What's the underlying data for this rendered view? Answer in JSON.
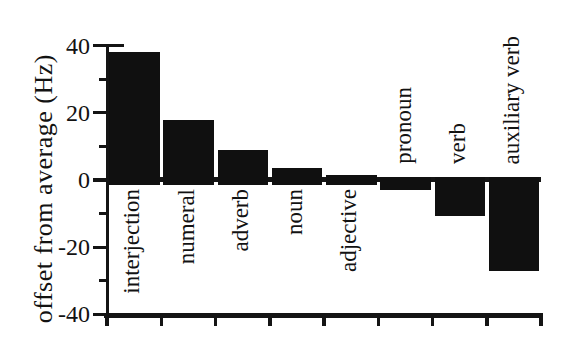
{
  "figure": {
    "background": "#ffffff",
    "ink_color": "#141414"
  },
  "chart_data": {
    "type": "bar",
    "title": "",
    "xlabel": "",
    "ylabel": "offset from average (Hz)",
    "ylim": [
      -40,
      40
    ],
    "y_major_ticks": [
      40,
      20,
      0,
      -20,
      -40
    ],
    "y_tick_labels": [
      "40",
      "20",
      "0",
      "-20",
      "-40"
    ],
    "y_minor_ticks": [
      30,
      10,
      -10,
      -30
    ],
    "categories": [
      "interjection",
      "numeral",
      "adverb",
      "noun",
      "adjective",
      "pronoun",
      "verb",
      "auxiliary verb"
    ],
    "values": [
      38,
      18,
      9,
      3.5,
      1.5,
      -2.5,
      -10,
      -26.5
    ],
    "bar_color": "#101010",
    "grid": false,
    "legend": "none",
    "style_notes": "solid black bars on white; zero baseline drawn as thick horizontal line; category labels rotated 90deg, placed below baseline for positive bars and above baseline for negative bars"
  }
}
